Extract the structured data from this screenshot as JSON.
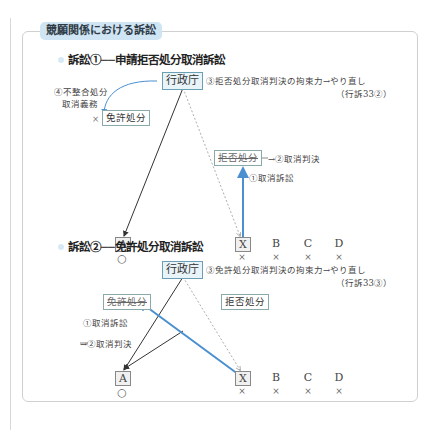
{
  "title": "競願関係における訴訟",
  "suit1": {
    "heading": "訴訟①──申請拒否処分取消訴訟",
    "agency": "行政庁",
    "note_binding": "③拒否処分取消判決の拘束力→やり直し",
    "note_binding_ref": "（行訴33②）",
    "note_duty_line1": "④不整合処分",
    "note_duty_line2": "取消義務",
    "cross_mark": "×",
    "license_disposition": "免許処分",
    "rejection_disposition": "拒否処分",
    "judgment": "→②取消判決",
    "lawsuit": "①取消訴訟",
    "parties": [
      {
        "label": "A",
        "mark": "○",
        "boxed": true
      },
      {
        "label": "X",
        "mark": "×",
        "boxed": true
      },
      {
        "label": "B",
        "mark": "×",
        "boxed": false
      },
      {
        "label": "C",
        "mark": "×",
        "boxed": false
      },
      {
        "label": "D",
        "mark": "×",
        "boxed": false
      }
    ]
  },
  "suit2": {
    "heading": "訴訟②──免許処分取消訴訟",
    "agency": "行政庁",
    "note_binding": "③免許処分取消判決の拘束力→やり直し",
    "note_binding_ref": "（行訴33③）",
    "license_disposition": "免許処分",
    "rejection_disposition": "拒否処分",
    "lawsuit": "①取消訴訟",
    "judgment": "→②取消判決",
    "parties": [
      {
        "label": "A",
        "mark": "○",
        "boxed": true
      },
      {
        "label": "X",
        "mark": "×",
        "boxed": true
      },
      {
        "label": "B",
        "mark": "×",
        "boxed": false
      },
      {
        "label": "C",
        "mark": "×",
        "boxed": false
      },
      {
        "label": "D",
        "mark": "×",
        "boxed": false
      }
    ]
  },
  "colors": {
    "accent_blue": "#4a8fd0",
    "pill_bg": "#cfe5f4",
    "agency_border": "#6a9fb5"
  }
}
